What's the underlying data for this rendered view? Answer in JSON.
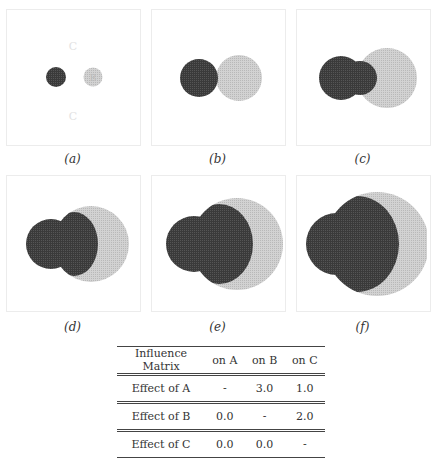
{
  "panels": [
    {
      "caption": "(a)"
    },
    {
      "caption": "(b)"
    },
    {
      "caption": "(c)"
    },
    {
      "caption": "(d)"
    },
    {
      "caption": "(e)"
    },
    {
      "caption": "(f)"
    }
  ],
  "panel_a_labels": {
    "top": "C",
    "bottom": "C",
    "right_circle": "B"
  },
  "colors": {
    "dark": "#3a3a3a",
    "light": "#cfcfcf",
    "frame": "#ececec"
  },
  "table": {
    "headers": [
      "Influence Matrix",
      "on A",
      "on B",
      "on C"
    ],
    "rows": [
      [
        "Effect of A",
        "-",
        "3.0",
        "1.0"
      ],
      [
        "Effect of B",
        "0.0",
        "-",
        "2.0"
      ],
      [
        "Effect of C",
        "0.0",
        "0.0",
        "-"
      ]
    ]
  }
}
